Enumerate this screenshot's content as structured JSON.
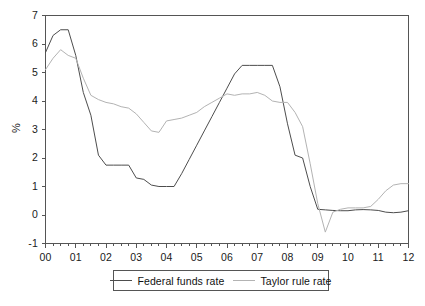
{
  "chart_data": {
    "type": "line",
    "title": "",
    "subtitle": "",
    "xlabel": "",
    "ylabel": "%",
    "xlim": [
      2000,
      2012
    ],
    "ylim": [
      -1,
      7
    ],
    "grid": false,
    "legend_position": "bottom",
    "y_ticks": [
      7,
      6,
      5,
      4,
      3,
      2,
      1,
      0,
      -1
    ],
    "y_tick_labels": [
      "7",
      "6",
      "5",
      "4",
      "3",
      "2",
      "1",
      "0",
      "-1"
    ],
    "x_ticks": [
      2000,
      2001,
      2002,
      2003,
      2004,
      2005,
      2006,
      2007,
      2008,
      2009,
      2010,
      2011,
      2012
    ],
    "x_tick_labels": [
      "00",
      "01",
      "02",
      "03",
      "04",
      "05",
      "06",
      "07",
      "08",
      "09",
      "10",
      "11",
      "12"
    ],
    "x_minor_tick_interval": 0.25,
    "colors": {
      "federal_funds_rate": "#4d4d4d",
      "taylor_rule_rate": "#b3b3b3",
      "axis": "#555555",
      "text": "#1a1a1a"
    },
    "x": [
      2000.0,
      2000.25,
      2000.5,
      2000.75,
      2001.0,
      2001.25,
      2001.5,
      2001.75,
      2002.0,
      2002.25,
      2002.5,
      2002.75,
      2003.0,
      2003.25,
      2003.5,
      2003.75,
      2004.0,
      2004.25,
      2004.5,
      2004.75,
      2005.0,
      2005.25,
      2005.5,
      2005.75,
      2006.0,
      2006.25,
      2006.5,
      2006.75,
      2007.0,
      2007.25,
      2007.5,
      2007.75,
      2008.0,
      2008.25,
      2008.5,
      2008.75,
      2009.0,
      2009.25,
      2009.5,
      2009.75,
      2010.0,
      2010.25,
      2010.5,
      2010.75,
      2011.0,
      2011.25,
      2011.5,
      2011.75,
      2012.0
    ],
    "series": [
      {
        "name": "Federal funds rate",
        "color": "#4d4d4d",
        "values": [
          5.7,
          6.3,
          6.5,
          6.5,
          5.6,
          4.3,
          3.5,
          2.1,
          1.75,
          1.75,
          1.75,
          1.75,
          1.3,
          1.25,
          1.05,
          1.0,
          1.0,
          1.0,
          1.45,
          1.95,
          2.45,
          2.95,
          3.45,
          3.95,
          4.45,
          4.95,
          5.25,
          5.25,
          5.25,
          5.25,
          5.25,
          4.5,
          3.2,
          2.1,
          2.0,
          1.0,
          0.2,
          0.18,
          0.16,
          0.15,
          0.15,
          0.18,
          0.19,
          0.18,
          0.16,
          0.1,
          0.08,
          0.1,
          0.15
        ]
      },
      {
        "name": "Taylor rule rate",
        "color": "#b3b3b3",
        "values": [
          5.1,
          5.5,
          5.8,
          5.6,
          5.5,
          4.8,
          4.2,
          4.05,
          3.95,
          3.9,
          3.8,
          3.75,
          3.55,
          3.25,
          2.95,
          2.9,
          3.3,
          3.35,
          3.4,
          3.5,
          3.6,
          3.8,
          3.95,
          4.1,
          4.25,
          4.2,
          4.25,
          4.25,
          4.3,
          4.2,
          4.0,
          3.95,
          3.95,
          3.6,
          3.1,
          1.8,
          0.4,
          -0.6,
          0.1,
          0.2,
          0.25,
          0.25,
          0.25,
          0.3,
          0.55,
          0.85,
          1.05,
          1.1,
          1.1
        ]
      }
    ]
  },
  "legend": {
    "entries": [
      {
        "label": "Federal funds rate"
      },
      {
        "label": "Taylor rule rate"
      }
    ]
  }
}
